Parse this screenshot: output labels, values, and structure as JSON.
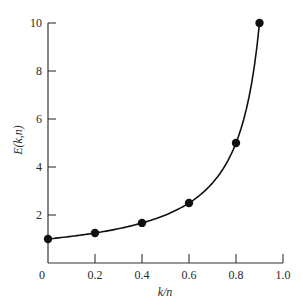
{
  "chart_data": {
    "type": "line",
    "title": "",
    "xlabel": "k/n",
    "ylabel": "E(k,n)",
    "xlim": [
      0,
      1.0
    ],
    "ylim": [
      0,
      10
    ],
    "grid": false,
    "legend": null,
    "x_ticks": [
      0,
      0.2,
      0.4,
      0.6,
      0.8,
      1.0
    ],
    "x_tick_labels": [
      "0",
      "0.2",
      "0.4",
      "0.6",
      "0.8",
      "1.0"
    ],
    "y_ticks": [
      2,
      4,
      6,
      8,
      10
    ],
    "y_tick_labels": [
      "2",
      "4",
      "6",
      "8",
      "10"
    ],
    "series": [
      {
        "name": "E(k,n)",
        "style": "smooth curve with filled circle markers",
        "x": [
          0,
          0.2,
          0.4,
          0.6,
          0.8,
          0.9
        ],
        "values": [
          1.0,
          1.25,
          1.67,
          2.5,
          5.0,
          10.0
        ]
      }
    ],
    "colors": {
      "line": "#111111",
      "marker": "#111111",
      "axis": "#333333"
    }
  }
}
